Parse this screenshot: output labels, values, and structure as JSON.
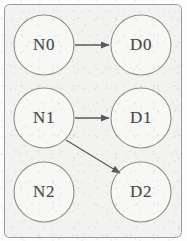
{
  "diagram": {
    "background_color": "#f2f2f0",
    "panel_border_color": "#9a9a9a",
    "node_fill_color": "#f7f7f5",
    "node_stroke_color": "#8d8d8d",
    "label_color": "#4a4a4a",
    "edge_color": "#595959",
    "nodes": [
      {
        "id": "n0",
        "label": "N0",
        "cx": 44,
        "cy": 45,
        "r": 30
      },
      {
        "id": "d0",
        "label": "D0",
        "cx": 141,
        "cy": 45,
        "r": 30
      },
      {
        "id": "n1",
        "label": "N1",
        "cx": 44,
        "cy": 118,
        "r": 30
      },
      {
        "id": "d1",
        "label": "D1",
        "cx": 141,
        "cy": 118,
        "r": 30
      },
      {
        "id": "n2",
        "label": "N2",
        "cx": 44,
        "cy": 192,
        "r": 30
      },
      {
        "id": "d2",
        "label": "D2",
        "cx": 141,
        "cy": 192,
        "r": 30
      }
    ],
    "edges": [
      {
        "id": "e-n0-d0",
        "from": "N0",
        "to": "D0",
        "x1": 75,
        "y1": 45,
        "x2": 109,
        "y2": 45,
        "kind": "straight-arrow"
      },
      {
        "id": "e-n1-d1",
        "from": "N1",
        "to": "D1",
        "x1": 75,
        "y1": 118,
        "x2": 109,
        "y2": 118,
        "kind": "straight-arrow"
      },
      {
        "id": "e-n1-d2",
        "from": "N1",
        "to": "D2",
        "x1": 66,
        "y1": 140,
        "x2": 120,
        "y2": 173,
        "kind": "diagonal-arrow"
      }
    ],
    "panel": {
      "x": 4,
      "y": 4,
      "width": 177,
      "height": 233,
      "radius": 5
    }
  }
}
